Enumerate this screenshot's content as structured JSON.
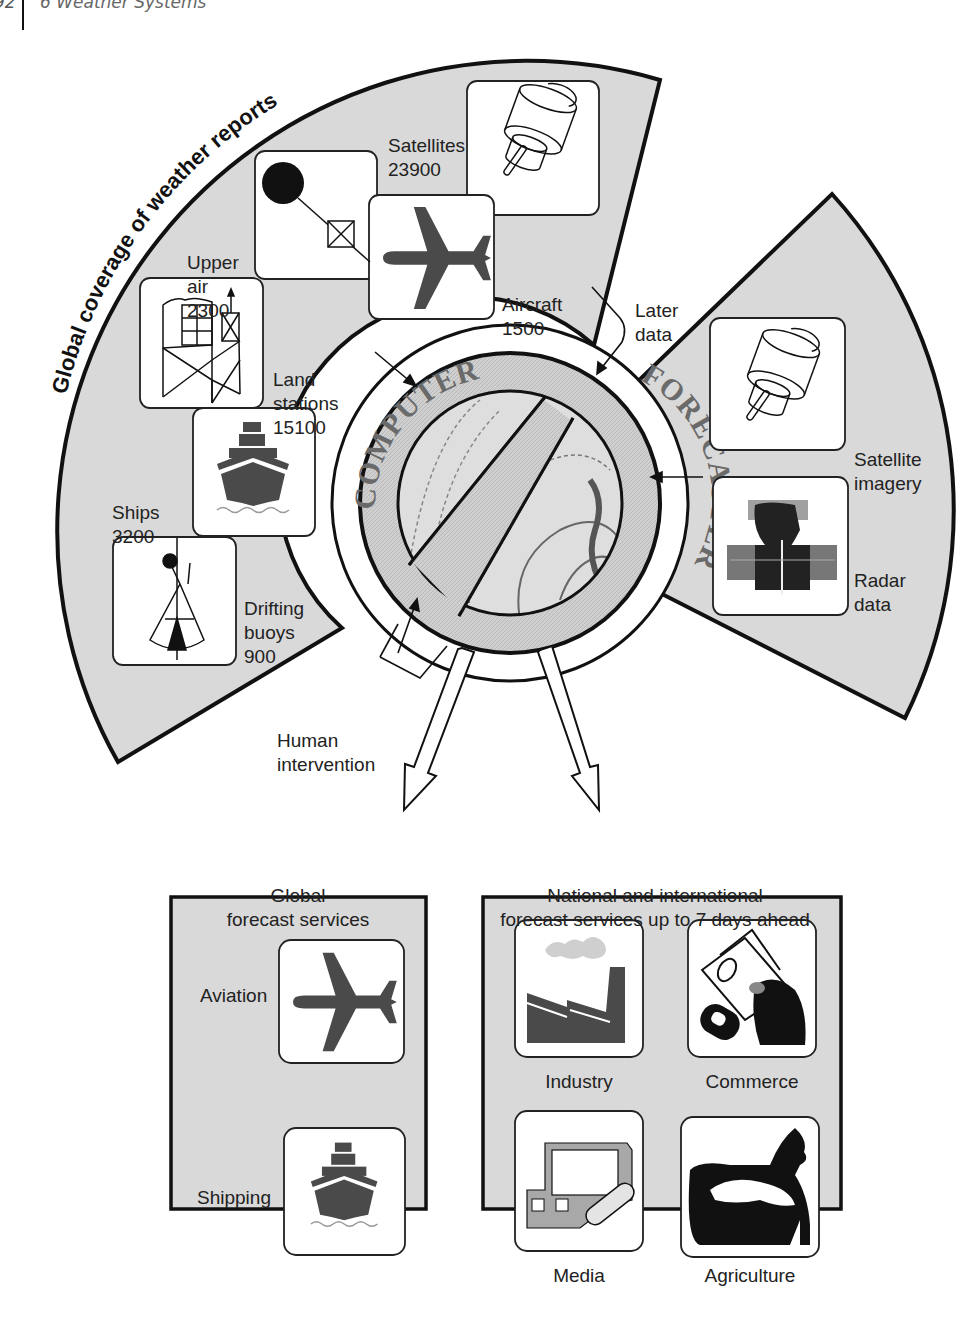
{
  "header": {
    "page_number": "92",
    "chapter": "6  Weather Systems"
  },
  "diagram": {
    "arc_title": "Global coverage of weather reports",
    "observations": [
      {
        "id": "satellites",
        "name": "Satellites",
        "count": "23900",
        "icon": "satellite-icon"
      },
      {
        "id": "upper-air",
        "name_line1": "Upper",
        "name_line2": "air",
        "count": "2300",
        "icon": "balloon-sonde-icon"
      },
      {
        "id": "aircraft",
        "name": "Aircraft",
        "count": "1500",
        "icon": "airplane-icon"
      },
      {
        "id": "land-stations",
        "name_line1": "Land",
        "name_line2": "stations",
        "count": "15100",
        "icon": "weather-station-icon"
      },
      {
        "id": "ships",
        "name": "Ships",
        "count": "3200",
        "icon": "ship-icon"
      },
      {
        "id": "drifting-buoys",
        "name_line1": "Drifting",
        "name_line2": "buoys",
        "count": "900",
        "icon": "buoy-icon"
      }
    ],
    "later_data": {
      "line1": "Later",
      "line2": "data"
    },
    "right_inputs": [
      {
        "id": "satellite-imagery",
        "line1": "Satellite",
        "line2": "imagery",
        "icon": "satellite-icon"
      },
      {
        "id": "radar-data",
        "line1": "Radar",
        "line2": "data",
        "icon": "radar-image-icon"
      }
    ],
    "hub": {
      "top_text": "COMPUTER",
      "bottom_text": "FORECASTER"
    },
    "human_intervention": {
      "line1": "Human",
      "line2": "intervention"
    },
    "outputs": {
      "global": {
        "title_line1": "Global",
        "title_line2": "forecast services",
        "items": [
          {
            "label": "Aviation",
            "icon": "airplane-icon"
          },
          {
            "label": "Shipping",
            "icon": "ship-icon"
          }
        ]
      },
      "national": {
        "title_line1": "National and international",
        "title_line2": "forecast services up to 7 days ahead",
        "items": [
          {
            "label": "Industry",
            "icon": "factory-icon"
          },
          {
            "label": "Commerce",
            "icon": "money-hand-icon"
          },
          {
            "label": "Media",
            "icon": "tv-radio-icon"
          },
          {
            "label": "Agriculture",
            "icon": "livestock-icon"
          }
        ]
      }
    },
    "colors": {
      "sector_fill": "#d9d9d9",
      "hub_fill": "#c8c8c8",
      "stroke": "#111111",
      "icon_dark": "#4a4a4a",
      "panel_fill": "#d9d9d9"
    }
  }
}
